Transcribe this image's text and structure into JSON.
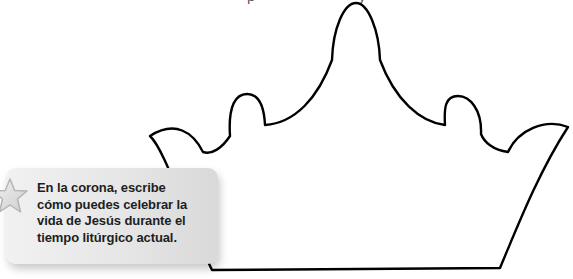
{
  "header": {
    "cutoff_text": "· · · · · · · · · · · · p · · · · · · · · · · · y ·"
  },
  "instruction": {
    "icon": "star-icon",
    "lines": [
      "En la corona, escribe",
      "cómo puedes celebrar la",
      "vida de Jesús durante el",
      "tiempo litúrgico actual."
    ]
  },
  "crown": {
    "label": "crown-outline",
    "stroke_color": "#000000",
    "fill_color": "#ffffff"
  },
  "colors": {
    "box_light": "#f1f1f1",
    "box_dark": "#d9d9d9",
    "text": "#1e1e1e",
    "star_fill": "#dcdcdc",
    "star_stroke": "#b5b5b5"
  }
}
